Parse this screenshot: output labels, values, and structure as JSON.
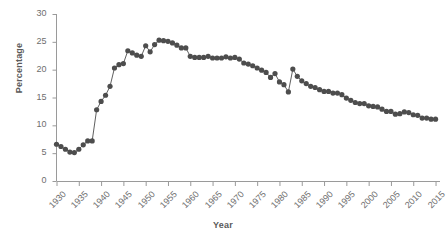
{
  "chart_data": {
    "type": "line",
    "title": "",
    "xlabel": "Year",
    "ylabel": "Percentage",
    "xlim": [
      1930,
      2016
    ],
    "ylim": [
      0,
      30
    ],
    "xticks": [
      "1930",
      "1935",
      "1940",
      "1945",
      "1950",
      "1955",
      "1960",
      "1965",
      "1970",
      "1975",
      "1980",
      "1985",
      "1990",
      "1995",
      "2000",
      "2005",
      "2010",
      "2015"
    ],
    "yticks": [
      "0",
      "5",
      "10",
      "15",
      "20",
      "25",
      "30"
    ],
    "grid": false,
    "legend": null,
    "marker": "circle",
    "series": [
      {
        "name": "Percentage",
        "color": "#4d4d4d",
        "x": [
          1930,
          1931,
          1932,
          1933,
          1934,
          1935,
          1936,
          1937,
          1938,
          1939,
          1940,
          1941,
          1942,
          1943,
          1944,
          1945,
          1946,
          1947,
          1948,
          1949,
          1950,
          1951,
          1952,
          1953,
          1954,
          1955,
          1956,
          1957,
          1958,
          1959,
          1960,
          1961,
          1962,
          1963,
          1964,
          1965,
          1966,
          1967,
          1968,
          1969,
          1970,
          1971,
          1972,
          1973,
          1974,
          1975,
          1976,
          1977,
          1978,
          1979,
          1980,
          1981,
          1982,
          1983,
          1984,
          1985,
          1986,
          1987,
          1988,
          1989,
          1990,
          1991,
          1992,
          1993,
          1994,
          1995,
          1996,
          1997,
          1998,
          1999,
          2000,
          2001,
          2002,
          2003,
          2004,
          2005,
          2006,
          2007,
          2008,
          2009,
          2010,
          2011,
          2012,
          2013,
          2014,
          2015
        ],
        "y": [
          6.6,
          6.2,
          5.7,
          5.2,
          5.1,
          5.7,
          6.5,
          7.2,
          7.2,
          12.8,
          14.3,
          15.4,
          17.0,
          20.3,
          20.9,
          21.1,
          23.4,
          23.0,
          22.6,
          22.4,
          24.3,
          23.2,
          24.5,
          25.3,
          25.2,
          25.1,
          24.8,
          24.4,
          23.9,
          23.9,
          22.4,
          22.2,
          22.2,
          22.2,
          22.4,
          22.1,
          22.1,
          22.1,
          22.3,
          22.1,
          22.2,
          21.9,
          21.2,
          21.0,
          20.7,
          20.3,
          19.9,
          19.5,
          18.6,
          19.3,
          17.8,
          17.3,
          16.0,
          20.1,
          18.8,
          18.0,
          17.5,
          17.0,
          16.8,
          16.4,
          16.1,
          16.1,
          15.8,
          15.8,
          15.5,
          14.9,
          14.5,
          14.1,
          13.9,
          13.9,
          13.5,
          13.4,
          13.3,
          12.9,
          12.5,
          12.5,
          12.0,
          12.1,
          12.4,
          12.3,
          11.9,
          11.8,
          11.3,
          11.3,
          11.1,
          11.1
        ]
      }
    ]
  },
  "axes": {
    "y_axis_name": "percentage-axis",
    "x_axis_name": "year-axis"
  }
}
